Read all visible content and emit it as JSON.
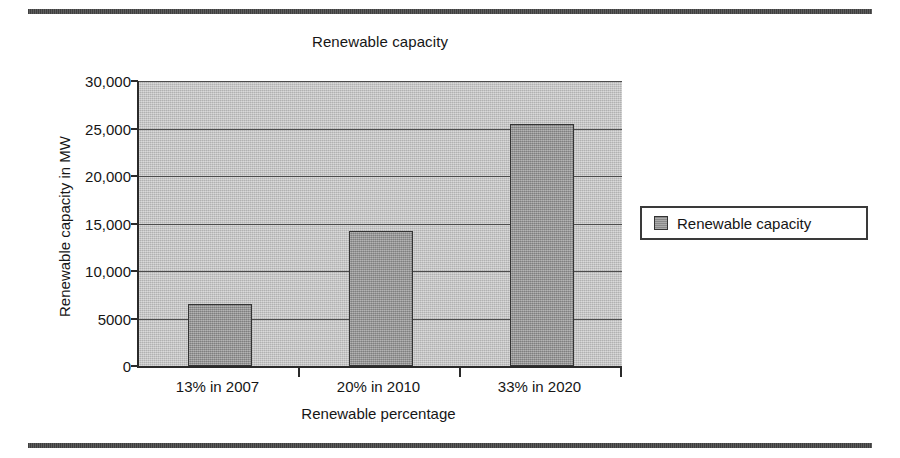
{
  "figure": {
    "top_rule": "horizontal-rule",
    "bottom_rule": "horizontal-rule"
  },
  "legend": {
    "position": "right",
    "entries": [
      {
        "label": "Renewable capacity",
        "color": "#999999"
      }
    ]
  },
  "colors": {
    "plot_background": "#c3c3c3",
    "bar_fill": "#999999",
    "bar_border": "#333333",
    "gridline": "#4c4c4c",
    "axis": "#2a2a2a",
    "rule": "#4a4a4a",
    "text": "#161616"
  },
  "chart_data": {
    "type": "bar",
    "title": "Renewable capacity",
    "xlabel": "Renewable percentage",
    "ylabel": "Renewable capacity in MW",
    "categories": [
      "13% in 2007",
      "20% in 2010",
      "33% in 2020"
    ],
    "values": [
      6500,
      14200,
      25500
    ],
    "series": [
      {
        "name": "Renewable capacity",
        "values": [
          6500,
          14200,
          25500
        ]
      }
    ],
    "ylim": [
      0,
      30000
    ],
    "yticks": [
      0,
      5000,
      10000,
      15000,
      20000,
      25000,
      30000
    ],
    "ytick_labels": [
      "0",
      "5000",
      "10,000",
      "15,000",
      "20,000",
      "25,000",
      "30,000"
    ],
    "grid": "horizontal",
    "legend_position": "right"
  }
}
